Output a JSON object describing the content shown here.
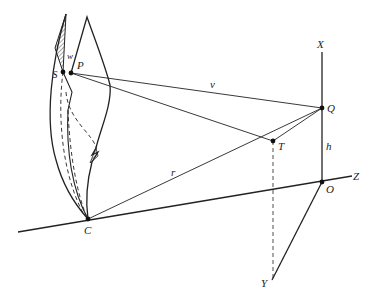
{
  "diagram": {
    "points": {
      "S": "S",
      "P": "P",
      "C": "C",
      "Q": "Q",
      "T": "T",
      "O": "O"
    },
    "axes": {
      "X": "X",
      "Y": "Y",
      "Z": "Z"
    },
    "segments": {
      "v": "v",
      "r": "r",
      "h": "h",
      "w": "w"
    },
    "colors": {
      "ink": "#222222",
      "background": "#ffffff"
    }
  }
}
